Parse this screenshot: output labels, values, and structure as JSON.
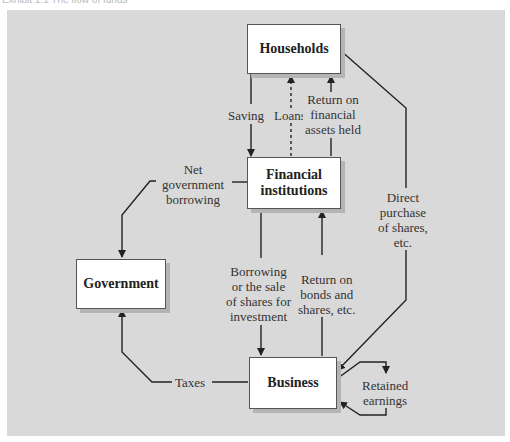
{
  "caption": "Exhibit 1.1 The flow of funds",
  "nodes": {
    "households": "Households",
    "financial_institutions": "Financial\ninstitutions",
    "government": "Government",
    "business": "Business"
  },
  "flows": {
    "saving": "Saving",
    "loans": "Loans",
    "return_financial": "Return on\nfinancial\nassets held",
    "net_gov_borrowing": "Net\ngovernment\nborrowing",
    "direct_purchase": "Direct\npurchase\nof shares,\netc.",
    "borrowing_sale": "Borrowing\nor the sale\nof shares for\ninvestment",
    "return_bonds": "Return on\nbonds and\nshares, etc.",
    "taxes": "Taxes",
    "retained": "Retained\nearnings"
  },
  "colors": {
    "panel": "#d9d9d9",
    "box": "#ffffff",
    "line": "#222222"
  }
}
